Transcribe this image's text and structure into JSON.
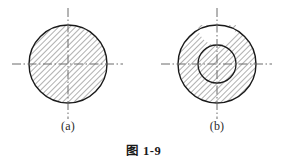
{
  "figure": {
    "caption": "图 1-9",
    "background_color": "#ffffff",
    "line_color": "#1a1a1a",
    "hatch_color": "#3a3a3a",
    "centerline_color": "#6b6b6b",
    "parts": [
      {
        "id": "a",
        "label": "(a)",
        "type": "solid-circle",
        "center_x": 68,
        "center_y": 64,
        "outer_radius": 39,
        "inner_radius": 0,
        "hatch_angle_deg": 45,
        "hatch_spacing_px": 4,
        "centerline_h_start_x": 12,
        "centerline_h_end_x": 123,
        "centerline_v_start_y": 8,
        "centerline_v_end_y": 119
      },
      {
        "id": "b",
        "label": "(b)",
        "type": "annulus",
        "center_x": 217,
        "center_y": 64,
        "outer_radius": 39,
        "inner_radius": 19,
        "hatch_angle_deg": 45,
        "hatch_spacing_px": 4,
        "centerline_h_start_x": 161,
        "centerline_h_end_x": 272,
        "centerline_v_start_y": 8,
        "centerline_v_end_y": 119
      }
    ]
  }
}
